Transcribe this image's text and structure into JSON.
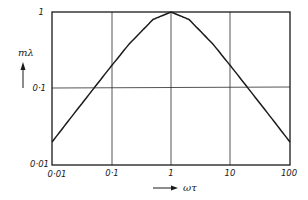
{
  "chart_data": {
    "type": "line",
    "title": "",
    "xlabel": "ωτ",
    "ylabel": "mλ",
    "xscale": "log",
    "yscale": "log",
    "xlim": [
      0.01,
      100
    ],
    "ylim": [
      0.01,
      1
    ],
    "grid": true,
    "legend": null,
    "x_ticks": [
      "0·01",
      "0·1",
      "1",
      "10",
      "100"
    ],
    "y_ticks": [
      "0·01",
      "0·1",
      "1"
    ],
    "series": [
      {
        "name": "mλ",
        "x": [
          0.01,
          0.02,
          0.05,
          0.1,
          0.2,
          0.5,
          1,
          2,
          5,
          10,
          20,
          50,
          100
        ],
        "values": [
          0.02,
          0.04,
          0.0998,
          0.198,
          0.385,
          0.8,
          1.0,
          0.8,
          0.385,
          0.198,
          0.0998,
          0.04,
          0.02
        ]
      }
    ]
  },
  "labels": {
    "y_axis": "mλ",
    "x_axis": "ωτ",
    "y_tick_1": "1",
    "y_tick_01": "0·1",
    "y_tick_001": "0·01",
    "x_tick_001": "0·01",
    "x_tick_01": "0·1",
    "x_tick_1": "1",
    "x_tick_10": "10",
    "x_tick_100": "100"
  },
  "colors": {
    "line": "#1a1a1a",
    "grid": "#1a1a1a",
    "background": "#ffffff"
  }
}
